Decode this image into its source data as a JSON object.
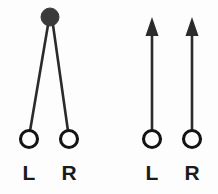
{
  "figure": {
    "background_color": "#fdfdfd",
    "ink_color": "#2b2b2b",
    "dot_color": "#3a3a3a",
    "width": 218,
    "height": 194,
    "panels": [
      {
        "id": "left-panel",
        "name": "converging-source-panel",
        "description": "Single sound source above with straight paths converging to both ears",
        "source_marker": {
          "type": "filled-circle",
          "cx": 50,
          "cy": 17,
          "r": 9,
          "color": "#3a3a3a"
        },
        "paths": [
          {
            "name": "path-to-left-ear",
            "x1": 48,
            "y1": 25,
            "x2": 30,
            "y2": 131
          },
          {
            "name": "path-to-right-ear",
            "x1": 53,
            "y1": 25,
            "x2": 68,
            "y2": 131
          }
        ],
        "ears": [
          {
            "label": "L",
            "name": "left-ear",
            "cx": 29,
            "cy": 139,
            "r": 8.5,
            "label_x": 29,
            "label_y": 180
          },
          {
            "label": "R",
            "name": "right-ear",
            "cx": 69,
            "cy": 139,
            "r": 8.5,
            "label_x": 69,
            "label_y": 180
          }
        ]
      },
      {
        "id": "right-panel",
        "name": "parallel-arrows-panel",
        "description": "Two parallel upward-pointing arrows rising from each ear",
        "source_marker": null,
        "arrows": [
          {
            "name": "arrow-left-ear",
            "x": 152,
            "y_bottom": 131,
            "y_top": 20,
            "head_width": 13,
            "head_height": 18
          },
          {
            "name": "arrow-right-ear",
            "x": 192,
            "y_bottom": 131,
            "y_top": 20,
            "head_width": 13,
            "head_height": 18
          }
        ],
        "ears": [
          {
            "label": "L",
            "name": "left-ear",
            "cx": 152,
            "cy": 139,
            "r": 8.5,
            "label_x": 152,
            "label_y": 180
          },
          {
            "label": "R",
            "name": "right-ear",
            "cx": 192,
            "cy": 139,
            "r": 8.5,
            "label_x": 192,
            "label_y": 180
          }
        ]
      }
    ]
  }
}
